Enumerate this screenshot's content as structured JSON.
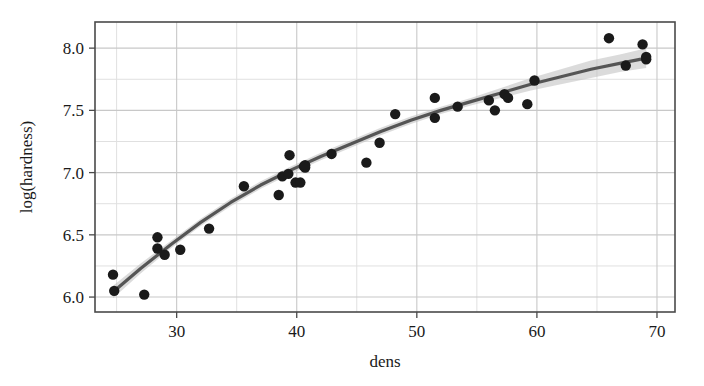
{
  "figure": {
    "width": 704,
    "height": 386,
    "background": "#ffffff"
  },
  "chart_data": {
    "type": "scatter",
    "title": "",
    "subtitle": "",
    "xlabel": "dens",
    "ylabel": "log(hardness)",
    "xlim": [
      23.2,
      71.5
    ],
    "ylim": [
      5.88,
      8.21
    ],
    "xticks": [
      30,
      40,
      50,
      60,
      70
    ],
    "xtick_labels": [
      "30",
      "40",
      "50",
      "60",
      "70"
    ],
    "yticks": [
      6.0,
      6.5,
      7.0,
      7.5,
      8.0
    ],
    "ytick_labels": [
      "6.0",
      "6.5",
      "7.0",
      "7.5",
      "8.0"
    ],
    "x_minor_ticks": [
      25,
      35,
      45,
      55,
      65
    ],
    "y_minor_ticks": [
      6.25,
      6.75,
      7.25,
      7.75
    ],
    "grid": true,
    "grid_color": "#c8c8c8",
    "minor_grid_color": "#e0e0e0",
    "panel_border_color": "#4a4a4a",
    "legend": "none",
    "point_color": "#1a1a1a",
    "point_size": 5.2,
    "point_shape": "circle",
    "fit_line_color": "#555555",
    "fit_line_width": 3.2,
    "fit_band_color": "#bdbdbd",
    "fit_band_opacity": 0.55,
    "x": [
      24.7,
      24.8,
      27.3,
      28.4,
      28.4,
      29.0,
      30.3,
      32.7,
      35.6,
      38.5,
      38.8,
      39.3,
      39.4,
      39.9,
      40.3,
      40.6,
      40.7,
      40.7,
      42.9,
      45.8,
      46.9,
      48.2,
      51.5,
      51.5,
      53.4,
      56.0,
      56.5,
      57.3,
      57.6,
      59.2,
      59.8,
      66.0,
      67.4,
      68.8,
      69.1,
      69.1
    ],
    "y": [
      6.18,
      6.05,
      6.02,
      6.48,
      6.39,
      6.34,
      6.38,
      6.55,
      6.89,
      6.82,
      6.97,
      6.99,
      7.14,
      6.92,
      6.92,
      7.05,
      7.04,
      7.06,
      7.15,
      7.08,
      7.24,
      7.47,
      7.44,
      7.6,
      7.53,
      7.58,
      7.5,
      7.63,
      7.6,
      7.55,
      7.74,
      8.08,
      7.86,
      8.03,
      7.93,
      7.91
    ],
    "points": [
      {
        "dens": 24.7,
        "log_hardness": 6.18
      },
      {
        "dens": 24.8,
        "log_hardness": 6.05
      },
      {
        "dens": 27.3,
        "log_hardness": 6.02
      },
      {
        "dens": 28.4,
        "log_hardness": 6.48
      },
      {
        "dens": 28.4,
        "log_hardness": 6.39
      },
      {
        "dens": 29.0,
        "log_hardness": 6.34
      },
      {
        "dens": 30.3,
        "log_hardness": 6.38
      },
      {
        "dens": 32.7,
        "log_hardness": 6.55
      },
      {
        "dens": 35.6,
        "log_hardness": 6.89
      },
      {
        "dens": 38.5,
        "log_hardness": 6.82
      },
      {
        "dens": 38.8,
        "log_hardness": 6.97
      },
      {
        "dens": 39.3,
        "log_hardness": 6.99
      },
      {
        "dens": 39.4,
        "log_hardness": 7.14
      },
      {
        "dens": 39.9,
        "log_hardness": 6.92
      },
      {
        "dens": 40.3,
        "log_hardness": 6.92
      },
      {
        "dens": 40.6,
        "log_hardness": 7.05
      },
      {
        "dens": 40.7,
        "log_hardness": 7.04
      },
      {
        "dens": 40.7,
        "log_hardness": 7.06
      },
      {
        "dens": 42.9,
        "log_hardness": 7.15
      },
      {
        "dens": 45.8,
        "log_hardness": 7.08
      },
      {
        "dens": 46.9,
        "log_hardness": 7.24
      },
      {
        "dens": 48.2,
        "log_hardness": 7.47
      },
      {
        "dens": 51.5,
        "log_hardness": 7.44
      },
      {
        "dens": 51.5,
        "log_hardness": 7.6
      },
      {
        "dens": 53.4,
        "log_hardness": 7.53
      },
      {
        "dens": 56.0,
        "log_hardness": 7.58
      },
      {
        "dens": 56.5,
        "log_hardness": 7.5
      },
      {
        "dens": 57.3,
        "log_hardness": 7.63
      },
      {
        "dens": 57.6,
        "log_hardness": 7.6
      },
      {
        "dens": 59.2,
        "log_hardness": 7.55
      },
      {
        "dens": 59.8,
        "log_hardness": 7.74
      },
      {
        "dens": 66.0,
        "log_hardness": 8.08
      },
      {
        "dens": 67.4,
        "log_hardness": 7.86
      },
      {
        "dens": 68.8,
        "log_hardness": 8.03
      },
      {
        "dens": 69.1,
        "log_hardness": 7.93
      },
      {
        "dens": 69.1,
        "log_hardness": 7.91
      }
    ],
    "fit": {
      "name": "smooth",
      "x": [
        24.7,
        27.0,
        29.5,
        32.0,
        34.5,
        37.0,
        39.5,
        42.0,
        44.5,
        47.0,
        49.5,
        52.0,
        54.5,
        57.0,
        59.5,
        62.0,
        64.5,
        67.0,
        69.1
      ],
      "y": [
        6.04,
        6.23,
        6.42,
        6.6,
        6.76,
        6.9,
        7.02,
        7.13,
        7.23,
        7.33,
        7.42,
        7.5,
        7.57,
        7.64,
        7.71,
        7.77,
        7.83,
        7.88,
        7.92
      ],
      "ymin": [
        5.99,
        6.19,
        6.39,
        6.57,
        6.73,
        6.87,
        6.99,
        7.1,
        7.2,
        7.3,
        7.39,
        7.47,
        7.54,
        7.6,
        7.66,
        7.71,
        7.76,
        7.81,
        7.84
      ],
      "ymax": [
        6.09,
        6.27,
        6.45,
        6.63,
        6.79,
        6.93,
        7.05,
        7.16,
        7.26,
        7.36,
        7.45,
        7.53,
        7.6,
        7.68,
        7.76,
        7.83,
        7.9,
        7.95,
        8.0
      ]
    }
  }
}
